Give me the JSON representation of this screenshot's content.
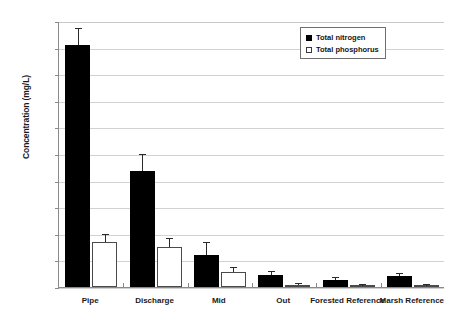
{
  "chart_data": {
    "type": "bar",
    "title": "",
    "xlabel": "",
    "ylabel": "Concentration (mg/L)",
    "ylim": [
      0.0,
      20.0
    ],
    "ytick_step": 2.0,
    "ytick_labels": [
      "0.0",
      "2.0",
      "4.0",
      "6.0",
      "8.0",
      "10.0",
      "12.0",
      "14.0",
      "16.0",
      "18.0",
      "20.0"
    ],
    "grid": true,
    "legend_position": "top-right",
    "categories": [
      "Pipe",
      "Discharge",
      "Mid",
      "Out",
      "Forested Reference",
      "Marsh Reference"
    ],
    "series": [
      {
        "name": "Total nitrogen",
        "color": "#000000",
        "fill": "solid",
        "values": [
          18.2,
          8.7,
          2.4,
          0.9,
          0.55,
          0.8
        ],
        "errors": [
          1.2,
          1.2,
          0.9,
          0.2,
          0.12,
          0.15
        ]
      },
      {
        "name": "Total phosphorus",
        "color": "#ffffff",
        "fill": "open",
        "values": [
          3.4,
          3.0,
          1.1,
          0.15,
          0.1,
          0.1
        ],
        "errors": [
          0.5,
          0.6,
          0.3,
          0.05,
          0.03,
          0.03
        ]
      }
    ]
  },
  "legend": {
    "items": [
      {
        "label": "Total nitrogen",
        "style": "filled"
      },
      {
        "label": "Total phosphorus",
        "style": "open"
      }
    ]
  },
  "axis": {
    "y_title": "Concentration (mg/L)"
  }
}
